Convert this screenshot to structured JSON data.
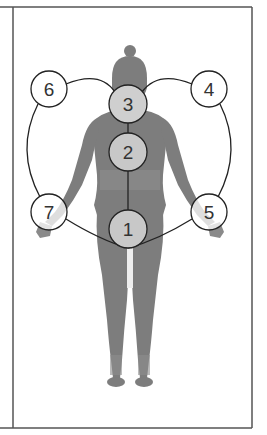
{
  "diagram": {
    "type": "body-points-network",
    "colors": {
      "body": "#7a7a7a",
      "body_light": "#8c8c8c",
      "node_fill_on_body": "#c8c8c8",
      "node_fill_off_body": "#ffffff",
      "line": "#222222",
      "frame": "#555555"
    },
    "nodes": [
      {
        "id": "1",
        "label": "1"
      },
      {
        "id": "2",
        "label": "2"
      },
      {
        "id": "3",
        "label": "3"
      },
      {
        "id": "4",
        "label": "4"
      },
      {
        "id": "5",
        "label": "5"
      },
      {
        "id": "6",
        "label": "6"
      },
      {
        "id": "7",
        "label": "7"
      }
    ]
  }
}
